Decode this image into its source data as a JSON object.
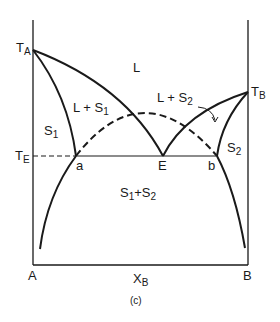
{
  "diagram": {
    "type": "binary-phase-diagram",
    "caption": "(c)",
    "axes": {
      "x_label": "X",
      "x_label_sub": "B",
      "left_end": "A",
      "right_end": "B"
    },
    "temperatures": {
      "ta_main": "T",
      "ta_sub": "A",
      "tb_main": "T",
      "tb_sub": "B",
      "te_main": "T",
      "te_sub": "E"
    },
    "points": {
      "a": "a",
      "e": "E",
      "b": "b"
    },
    "regions": {
      "liquid": "L",
      "l_s1_main": "L + S",
      "l_s1_sub": "1",
      "l_s2_main": "L + S",
      "l_s2_sub": "2",
      "s1_main": "S",
      "s1_sub": "1",
      "s2_main": "S",
      "s2_sub": "2",
      "s1s2_a": "S",
      "s1s2_a_sub": "1",
      "s1s2_plus": "+",
      "s1s2_b": "S",
      "s1s2_b_sub": "2"
    },
    "colors": {
      "line": "#1a1a1a",
      "background": "#ffffff"
    }
  }
}
